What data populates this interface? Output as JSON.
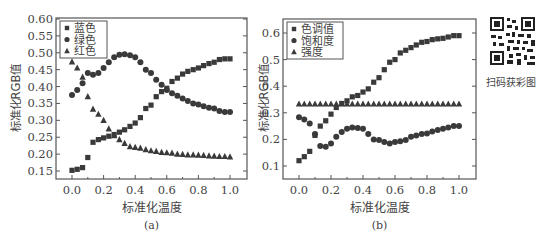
{
  "figure": {
    "qr_caption": "扫码获彩图"
  },
  "chart_data": [
    {
      "type": "scatter",
      "panel_label": "(a)",
      "title": "",
      "xlabel": "标准化温度",
      "ylabel": "标准化RGB值",
      "xlim": [
        -0.1,
        1.1
      ],
      "ylim": [
        0.125,
        0.6
      ],
      "xticks": [
        "0.0",
        "0.2",
        "0.4",
        "0.6",
        "0.8",
        "1.0"
      ],
      "yticks": [
        "0.15",
        "0.20",
        "0.25",
        "0.30",
        "0.35",
        "0.40",
        "0.45",
        "0.50",
        "0.55",
        "0.60"
      ],
      "grid": false,
      "legend_position": "upper-left",
      "x": [
        0,
        0.033,
        0.067,
        0.1,
        0.133,
        0.167,
        0.2,
        0.233,
        0.267,
        0.3,
        0.333,
        0.367,
        0.4,
        0.433,
        0.467,
        0.5,
        0.533,
        0.567,
        0.6,
        0.633,
        0.667,
        0.7,
        0.733,
        0.767,
        0.8,
        0.833,
        0.867,
        0.9,
        0.933,
        0.967,
        1.0
      ],
      "series": [
        {
          "name": "蓝色",
          "marker": "square",
          "values": [
            0.152,
            0.155,
            0.16,
            0.19,
            0.235,
            0.243,
            0.248,
            0.253,
            0.258,
            0.265,
            0.272,
            0.282,
            0.292,
            0.308,
            0.335,
            0.345,
            0.37,
            0.385,
            0.395,
            0.415,
            0.425,
            0.437,
            0.445,
            0.45,
            0.455,
            0.462,
            0.468,
            0.472,
            0.48,
            0.482,
            0.482
          ]
        },
        {
          "name": "绿色",
          "marker": "circle",
          "values": [
            0.375,
            0.39,
            0.41,
            0.44,
            0.435,
            0.44,
            0.455,
            0.472,
            0.487,
            0.494,
            0.496,
            0.493,
            0.487,
            0.472,
            0.45,
            0.44,
            0.42,
            0.405,
            0.39,
            0.38,
            0.373,
            0.365,
            0.357,
            0.35,
            0.347,
            0.342,
            0.337,
            0.335,
            0.328,
            0.325,
            0.325
          ]
        },
        {
          "name": "红色",
          "marker": "triangle",
          "values": [
            0.473,
            0.455,
            0.428,
            0.37,
            0.333,
            0.318,
            0.3,
            0.275,
            0.255,
            0.243,
            0.232,
            0.222,
            0.22,
            0.218,
            0.213,
            0.21,
            0.208,
            0.205,
            0.204,
            0.203,
            0.2,
            0.199,
            0.198,
            0.198,
            0.197,
            0.196,
            0.195,
            0.194,
            0.193,
            0.193,
            0.192
          ]
        }
      ]
    },
    {
      "type": "scatter",
      "panel_label": "(b)",
      "title": "",
      "xlabel": "标准化温度",
      "ylabel": "标准化RGB值",
      "xlim": [
        -0.1,
        1.1
      ],
      "ylim": [
        0.05,
        0.65
      ],
      "xticks": [
        "0.0",
        "0.2",
        "0.4",
        "0.6",
        "0.8",
        "1.0"
      ],
      "yticks": [
        "0.1",
        "0.2",
        "0.3",
        "0.4",
        "0.5",
        "0.6"
      ],
      "grid": false,
      "legend_position": "upper-left",
      "x": [
        0,
        0.033,
        0.067,
        0.1,
        0.133,
        0.167,
        0.2,
        0.233,
        0.267,
        0.3,
        0.333,
        0.367,
        0.4,
        0.433,
        0.467,
        0.5,
        0.533,
        0.567,
        0.6,
        0.633,
        0.667,
        0.7,
        0.733,
        0.767,
        0.8,
        0.833,
        0.867,
        0.9,
        0.933,
        0.967,
        1.0
      ],
      "series": [
        {
          "name": "色调值",
          "marker": "square",
          "values": [
            0.12,
            0.135,
            0.155,
            0.215,
            0.25,
            0.27,
            0.295,
            0.32,
            0.335,
            0.345,
            0.36,
            0.365,
            0.378,
            0.39,
            0.415,
            0.432,
            0.462,
            0.49,
            0.5,
            0.525,
            0.535,
            0.545,
            0.555,
            0.565,
            0.568,
            0.575,
            0.578,
            0.58,
            0.585,
            0.59,
            0.59
          ]
        },
        {
          "name": "饱和度",
          "marker": "circle",
          "values": [
            0.283,
            0.275,
            0.26,
            0.22,
            0.175,
            0.172,
            0.185,
            0.21,
            0.228,
            0.24,
            0.245,
            0.243,
            0.24,
            0.22,
            0.2,
            0.198,
            0.19,
            0.185,
            0.19,
            0.193,
            0.198,
            0.21,
            0.215,
            0.22,
            0.222,
            0.23,
            0.235,
            0.24,
            0.245,
            0.25,
            0.25
          ]
        },
        {
          "name": "强度",
          "marker": "triangle",
          "values": [
            0.333,
            0.333,
            0.333,
            0.333,
            0.333,
            0.333,
            0.333,
            0.333,
            0.333,
            0.333,
            0.333,
            0.333,
            0.333,
            0.333,
            0.333,
            0.333,
            0.333,
            0.333,
            0.333,
            0.333,
            0.333,
            0.333,
            0.333,
            0.333,
            0.333,
            0.333,
            0.333,
            0.333,
            0.333,
            0.333,
            0.333
          ]
        }
      ]
    }
  ]
}
